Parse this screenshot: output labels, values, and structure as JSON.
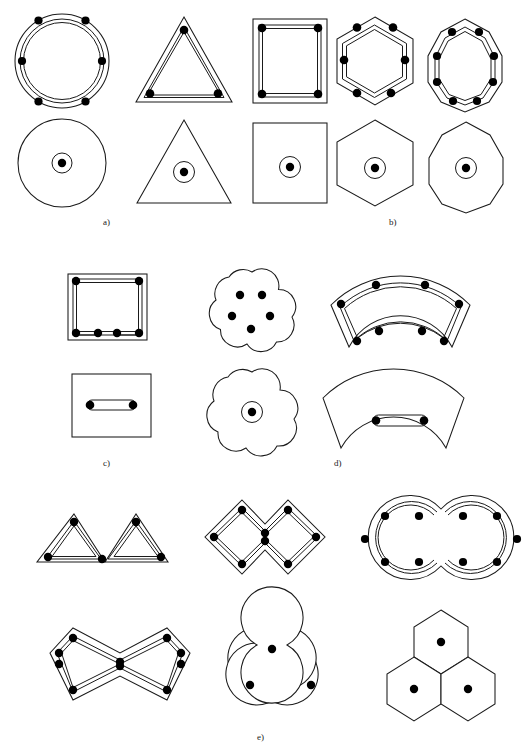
{
  "figure": {
    "background_color": "#ffffff",
    "line_color": "#1a1a1a",
    "bar_color": "#000000"
  },
  "captions": [
    {
      "id": "a",
      "label": "a)",
      "x": 103,
      "y": 218
    },
    {
      "id": "b",
      "label": "b)",
      "x": 389,
      "y": 218
    },
    {
      "id": "c",
      "label": "c)",
      "x": 103,
      "y": 459
    },
    {
      "id": "d",
      "label": "d)",
      "x": 334,
      "y": 459
    },
    {
      "id": "e",
      "label": "e)",
      "x": 257,
      "y": 734
    }
  ],
  "groups": [
    {
      "id": "a",
      "label": "a)",
      "sections": [
        {
          "name": "circular-section-reinforced",
          "shape": "circle",
          "row": "top",
          "bar_count": 6,
          "stirrup": "circular-hoop",
          "center_duct": false
        },
        {
          "name": "circular-section-plain",
          "shape": "circle",
          "row": "bottom",
          "bar_count": 0,
          "stirrup": "none",
          "center_duct": true
        }
      ]
    },
    {
      "id": "b",
      "label": "b)",
      "sections": [
        {
          "name": "triangular-section-reinforced",
          "shape": "triangle",
          "row": "top",
          "bar_count": 3,
          "stirrup": "polygonal-tie",
          "center_duct": false
        },
        {
          "name": "square-section-reinforced",
          "shape": "square",
          "row": "top",
          "bar_count": 4,
          "stirrup": "polygonal-tie",
          "center_duct": false
        },
        {
          "name": "hexagonal-section-reinforced",
          "shape": "hexagon",
          "row": "top",
          "bar_count": 6,
          "stirrup": "polygonal-tie",
          "center_duct": false
        },
        {
          "name": "octagonal-section-reinforced",
          "shape": "octagon",
          "row": "top",
          "bar_count": 8,
          "stirrup": "polygonal-tie",
          "center_duct": false
        },
        {
          "name": "triangular-section-plain",
          "shape": "triangle",
          "row": "bottom",
          "bar_count": 0,
          "stirrup": "none",
          "center_duct": true
        },
        {
          "name": "square-section-plain",
          "shape": "square",
          "row": "bottom",
          "bar_count": 0,
          "stirrup": "none",
          "center_duct": true
        },
        {
          "name": "hexagonal-section-plain",
          "shape": "hexagon",
          "row": "bottom",
          "bar_count": 0,
          "stirrup": "none",
          "center_duct": true
        },
        {
          "name": "octagonal-section-plain",
          "shape": "octagon",
          "row": "bottom",
          "bar_count": 0,
          "stirrup": "none",
          "center_duct": true
        }
      ]
    },
    {
      "id": "c",
      "label": "c)",
      "sections": [
        {
          "name": "rectangular-section-reinforced",
          "shape": "rectangle",
          "row": "top",
          "bar_count": 6,
          "stirrup": "rectangular-tie",
          "center_duct": false
        },
        {
          "name": "rectangular-section-with-slot",
          "shape": "rectangle",
          "row": "bottom",
          "bar_count": 2,
          "stirrup": "flat-capsule-duct",
          "center_duct": false
        }
      ]
    },
    {
      "id": "d",
      "label": "d)",
      "sections": [
        {
          "name": "five-lobe-section-reinforced",
          "shape": "five-lobed-cloud",
          "row": "top",
          "bar_count": 5,
          "stirrup": "none",
          "center_duct": false
        },
        {
          "name": "annular-sector-section-reinforced",
          "shape": "annular-sector",
          "row": "top",
          "bar_count": 8,
          "stirrup": "sector-tie",
          "center_duct": false
        },
        {
          "name": "five-lobe-section-plain",
          "shape": "five-lobed-cloud",
          "row": "bottom",
          "bar_count": 0,
          "stirrup": "none",
          "center_duct": true
        },
        {
          "name": "annular-sector-section-with-slot",
          "shape": "annular-sector",
          "row": "bottom",
          "bar_count": 2,
          "stirrup": "flat-capsule-duct",
          "center_duct": false
        }
      ]
    },
    {
      "id": "e",
      "label": "e)",
      "sections": [
        {
          "name": "double-peak-section-reinforced",
          "shape": "double-peak",
          "row": "top",
          "bar_count": 5,
          "stirrup": "twin-triangular-tie",
          "center_duct": false
        },
        {
          "name": "double-diamond-section-reinforced",
          "shape": "double-diamond-zigzag",
          "row": "top",
          "bar_count": 8,
          "stirrup": "zigzag-tie",
          "center_duct": false
        },
        {
          "name": "twin-circle-section-reinforced",
          "shape": "twin-circle",
          "row": "top",
          "bar_count": 10,
          "stirrup": "twin-circular-hoop",
          "center_duct": false
        },
        {
          "name": "double-hexagon-section-reinforced",
          "shape": "elongated-double-hexagon",
          "row": "bottom",
          "bar_count": 10,
          "stirrup": "polygonal-tie",
          "center_duct": false
        },
        {
          "name": "trefoil-section-plain",
          "shape": "trefoil",
          "row": "bottom",
          "bar_count": 3,
          "stirrup": "none",
          "center_duct": false
        },
        {
          "name": "hexagon-cluster-section-plain",
          "shape": "hexagon-cluster",
          "row": "bottom",
          "bar_count": 3,
          "stirrup": "none",
          "center_duct": false
        }
      ]
    }
  ]
}
